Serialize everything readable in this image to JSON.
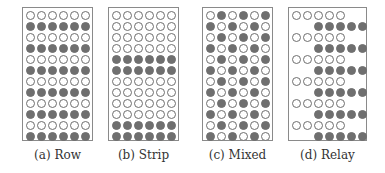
{
  "figure": {
    "panels": [
      {
        "id": "a",
        "caption": "(a) Row",
        "left": 22,
        "width": 71,
        "cols": 6,
        "col_offset": 0,
        "rows": [
          {
            "type": "w",
            "start": 0,
            "count": 6
          },
          {
            "type": "f",
            "start": 0,
            "count": 6
          },
          {
            "type": "w",
            "start": 0,
            "count": 6
          },
          {
            "type": "f",
            "start": 0,
            "count": 6
          },
          {
            "type": "w",
            "start": 0,
            "count": 6
          },
          {
            "type": "f",
            "start": 0,
            "count": 6
          },
          {
            "type": "w",
            "start": 0,
            "count": 6
          },
          {
            "type": "f",
            "start": 0,
            "count": 6
          },
          {
            "type": "w",
            "start": 0,
            "count": 6
          },
          {
            "type": "f",
            "start": 0,
            "count": 6
          },
          {
            "type": "w",
            "start": 0,
            "count": 6
          },
          {
            "type": "f",
            "start": 0,
            "count": 6
          }
        ]
      },
      {
        "id": "b",
        "caption": "(b) Strip",
        "left": 108,
        "width": 71,
        "cols": 6,
        "col_offset": 0,
        "rows": [
          {
            "type": "w",
            "start": 0,
            "count": 6
          },
          {
            "type": "w",
            "start": 0,
            "count": 6
          },
          {
            "type": "w",
            "start": 0,
            "count": 6
          },
          {
            "type": "w",
            "start": 0,
            "count": 6
          },
          {
            "type": "f",
            "start": 0,
            "count": 6
          },
          {
            "type": "f",
            "start": 0,
            "count": 6
          },
          {
            "type": "w",
            "start": 0,
            "count": 6
          },
          {
            "type": "w",
            "start": 0,
            "count": 6
          },
          {
            "type": "w",
            "start": 0,
            "count": 6
          },
          {
            "type": "w",
            "start": 0,
            "count": 6
          },
          {
            "type": "f",
            "start": 0,
            "count": 6
          },
          {
            "type": "f",
            "start": 0,
            "count": 6
          }
        ]
      },
      {
        "id": "c",
        "caption": "(c) Mixed",
        "left": 202,
        "width": 71,
        "cols": 6,
        "col_offset": 0,
        "rows": [
          {
            "type": "checker",
            "first": "w"
          },
          {
            "type": "checker",
            "first": "f"
          },
          {
            "type": "checker",
            "first": "w"
          },
          {
            "type": "checker",
            "first": "f"
          },
          {
            "type": "checker",
            "first": "w"
          },
          {
            "type": "checker",
            "first": "f"
          },
          {
            "type": "checker",
            "first": "w"
          },
          {
            "type": "checker",
            "first": "f"
          },
          {
            "type": "checker",
            "first": "w"
          },
          {
            "type": "checker",
            "first": "f"
          },
          {
            "type": "checker",
            "first": "w"
          },
          {
            "type": "checker",
            "first": "f"
          }
        ]
      },
      {
        "id": "d",
        "caption": "(d) Relay",
        "left": 288,
        "width": 79,
        "cols": 7,
        "col_offset": 0,
        "rows": [
          {
            "type": "w",
            "start": 0,
            "count": 5
          },
          {
            "type": "f",
            "start": 2,
            "count": 5
          },
          {
            "type": "w",
            "start": 0,
            "count": 5
          },
          {
            "type": "f",
            "start": 2,
            "count": 5
          },
          {
            "type": "w",
            "start": 0,
            "count": 5
          },
          {
            "type": "f",
            "start": 2,
            "count": 5
          },
          {
            "type": "w",
            "start": 0,
            "count": 5
          },
          {
            "type": "f",
            "start": 2,
            "count": 5
          },
          {
            "type": "w",
            "start": 0,
            "count": 5
          },
          {
            "type": "f",
            "start": 2,
            "count": 5
          },
          {
            "type": "w",
            "start": 0,
            "count": 5
          },
          {
            "type": "f",
            "start": 2,
            "count": 5
          }
        ]
      }
    ],
    "legend": {
      "white_circle": "empty / unassigned",
      "filled_circle": "filled / assigned"
    },
    "colors": {
      "filled": "#6f6f6f",
      "outline": "#6e6e6e",
      "frame": "#8a8a8a"
    }
  }
}
